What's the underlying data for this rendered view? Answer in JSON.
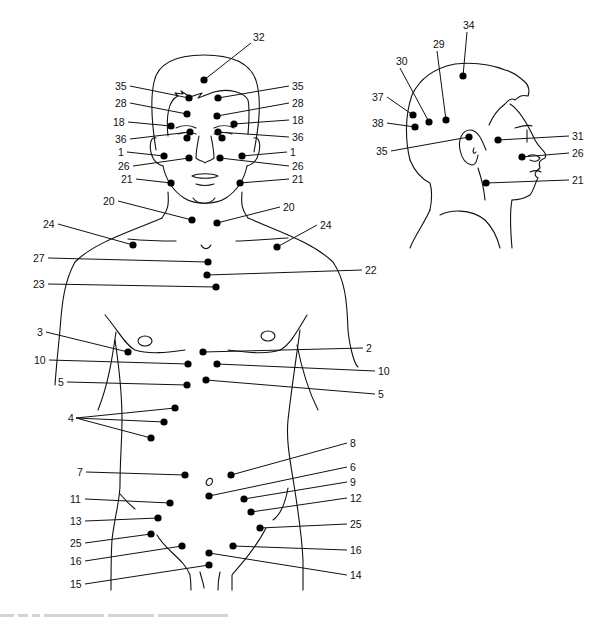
{
  "figure": {
    "caption_visible": false
  },
  "front_view": {
    "points": [
      {
        "label": "32",
        "dot": [
          204,
          80
        ],
        "label_pos": [
          253,
          41
        ],
        "side": "right-up"
      },
      {
        "label": "35",
        "dot": [
          189,
          98
        ],
        "label_pos": [
          115,
          90
        ],
        "side": "left"
      },
      {
        "label": "35",
        "dot": [
          218,
          98
        ],
        "label_pos": [
          292,
          90
        ],
        "side": "right"
      },
      {
        "label": "28",
        "dot": [
          187,
          114
        ],
        "label_pos": [
          115,
          107
        ],
        "side": "left"
      },
      {
        "label": "28",
        "dot": [
          217,
          116
        ],
        "label_pos": [
          292,
          107
        ],
        "side": "right"
      },
      {
        "label": "18",
        "dot": [
          171,
          126
        ],
        "label_pos": [
          113,
          126
        ],
        "side": "left"
      },
      {
        "label": "18",
        "dot": [
          234,
          124
        ],
        "label_pos": [
          292,
          124
        ],
        "side": "right"
      },
      {
        "label": "36",
        "dot": [
          190,
          132
        ],
        "label_pos": [
          115,
          143
        ],
        "side": "left"
      },
      {
        "label": "36",
        "dot": [
          218,
          132
        ],
        "label_pos": [
          292,
          141
        ],
        "side": "right"
      },
      {
        "label": "",
        "dot": [
          187,
          138
        ],
        "label_pos": null,
        "side": "none"
      },
      {
        "label": "",
        "dot": [
          222,
          138
        ],
        "label_pos": null,
        "side": "none"
      },
      {
        "label": "1",
        "dot": [
          164,
          156
        ],
        "label_pos": [
          118,
          156
        ],
        "side": "left"
      },
      {
        "label": "1",
        "dot": [
          242,
          156
        ],
        "label_pos": [
          290,
          156
        ],
        "side": "right"
      },
      {
        "label": "26",
        "dot": [
          189,
          158
        ],
        "label_pos": [
          118,
          170
        ],
        "side": "left"
      },
      {
        "label": "26",
        "dot": [
          220,
          158
        ],
        "label_pos": [
          292,
          170
        ],
        "side": "right"
      },
      {
        "label": "21",
        "dot": [
          171,
          183
        ],
        "label_pos": [
          121,
          183
        ],
        "side": "left"
      },
      {
        "label": "21",
        "dot": [
          240,
          183
        ],
        "label_pos": [
          292,
          183
        ],
        "side": "right"
      },
      {
        "label": "20",
        "dot": [
          192,
          220
        ],
        "label_pos": [
          103,
          205
        ],
        "side": "left"
      },
      {
        "label": "20",
        "dot": [
          217,
          223
        ],
        "label_pos": [
          283,
          211
        ],
        "side": "right"
      },
      {
        "label": "24",
        "dot": [
          133,
          245
        ],
        "label_pos": [
          43,
          228
        ],
        "side": "left"
      },
      {
        "label": "24",
        "dot": [
          277,
          247
        ],
        "label_pos": [
          320,
          229
        ],
        "side": "right"
      },
      {
        "label": "27",
        "dot": [
          208,
          262
        ],
        "label_pos": [
          33,
          262
        ],
        "side": "left"
      },
      {
        "label": "22",
        "dot": [
          207,
          275
        ],
        "label_pos": [
          365,
          274
        ],
        "side": "right"
      },
      {
        "label": "23",
        "dot": [
          216,
          287
        ],
        "label_pos": [
          33,
          288
        ],
        "side": "left"
      },
      {
        "label": "3",
        "dot": [
          128,
          352
        ],
        "label_pos": [
          37,
          336
        ],
        "side": "left"
      },
      {
        "label": "2",
        "dot": [
          203,
          352
        ],
        "label_pos": [
          366,
          352
        ],
        "side": "right"
      },
      {
        "label": "10",
        "dot": [
          188,
          364
        ],
        "label_pos": [
          34,
          364
        ],
        "side": "left"
      },
      {
        "label": "10",
        "dot": [
          217,
          364
        ],
        "label_pos": [
          378,
          375
        ],
        "side": "right"
      },
      {
        "label": "5",
        "dot": [
          187,
          385
        ],
        "label_pos": [
          58,
          386
        ],
        "side": "left"
      },
      {
        "label": "5",
        "dot": [
          206,
          380
        ],
        "label_pos": [
          378,
          398
        ],
        "side": "right"
      },
      {
        "label": "4",
        "dot": [
          175,
          408
        ],
        "label_pos": [
          68,
          422
        ],
        "side": "fan"
      },
      {
        "label": "",
        "dot": [
          164,
          422
        ],
        "label_pos": null,
        "side": "fan"
      },
      {
        "label": "",
        "dot": [
          151,
          438
        ],
        "label_pos": null,
        "side": "fan"
      },
      {
        "label": "7",
        "dot": [
          185,
          475
        ],
        "label_pos": [
          77,
          476
        ],
        "side": "left"
      },
      {
        "label": "8",
        "dot": [
          231,
          475
        ],
        "label_pos": [
          350,
          447
        ],
        "side": "right"
      },
      {
        "label": "6",
        "dot": [
          209,
          496
        ],
        "label_pos": [
          350,
          471
        ],
        "side": "right"
      },
      {
        "label": "9",
        "dot": [
          244,
          499
        ],
        "label_pos": [
          350,
          486
        ],
        "side": "right"
      },
      {
        "label": "11",
        "dot": [
          170,
          503
        ],
        "label_pos": [
          70,
          503
        ],
        "side": "left"
      },
      {
        "label": "12",
        "dot": [
          251,
          512
        ],
        "label_pos": [
          350,
          502
        ],
        "side": "right"
      },
      {
        "label": "13",
        "dot": [
          158,
          518
        ],
        "label_pos": [
          70,
          525
        ],
        "side": "left"
      },
      {
        "label": "25",
        "dot": [
          151,
          534
        ],
        "label_pos": [
          70,
          547
        ],
        "side": "left"
      },
      {
        "label": "25",
        "dot": [
          260,
          528
        ],
        "label_pos": [
          350,
          528
        ],
        "side": "right"
      },
      {
        "label": "16",
        "dot": [
          182,
          546
        ],
        "label_pos": [
          70,
          565
        ],
        "side": "left"
      },
      {
        "label": "16",
        "dot": [
          233,
          546
        ],
        "label_pos": [
          350,
          554
        ],
        "side": "right"
      },
      {
        "label": "14",
        "dot": [
          209,
          553
        ],
        "label_pos": [
          350,
          579
        ],
        "side": "right"
      },
      {
        "label": "15",
        "dot": [
          209,
          565
        ],
        "label_pos": [
          70,
          588
        ],
        "side": "left"
      }
    ]
  },
  "side_view": {
    "points": [
      {
        "label": "34",
        "dot": [
          463,
          76
        ],
        "label_pos": [
          463,
          29
        ],
        "side": "up"
      },
      {
        "label": "29",
        "dot": [
          446,
          120
        ],
        "label_pos": [
          433,
          48
        ],
        "side": "up"
      },
      {
        "label": "30",
        "dot": [
          429,
          122
        ],
        "label_pos": [
          396,
          65
        ],
        "side": "up"
      },
      {
        "label": "37",
        "dot": [
          413,
          115
        ],
        "label_pos": [
          372,
          101
        ],
        "side": "left"
      },
      {
        "label": "38",
        "dot": [
          415,
          127
        ],
        "label_pos": [
          372,
          127
        ],
        "side": "left"
      },
      {
        "label": "35",
        "dot": [
          469,
          137
        ],
        "label_pos": [
          376,
          155
        ],
        "side": "left"
      },
      {
        "label": "31",
        "dot": [
          498,
          140
        ],
        "label_pos": [
          572,
          140
        ],
        "side": "right"
      },
      {
        "label": "26",
        "dot": [
          522,
          157
        ],
        "label_pos": [
          572,
          157
        ],
        "side": "right"
      },
      {
        "label": "21",
        "dot": [
          486,
          183
        ],
        "label_pos": [
          572,
          184
        ],
        "side": "right"
      }
    ]
  },
  "colors": {
    "ink": "#111111",
    "background": "#ffffff",
    "caption": "#bbbbbb"
  }
}
